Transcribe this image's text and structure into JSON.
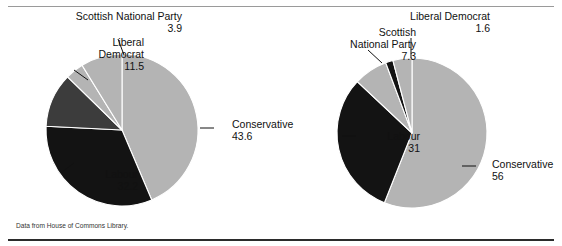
{
  "figure": {
    "source_note": "Data from House of Commons Library."
  },
  "chart_data": [
    {
      "type": "pie",
      "title": "",
      "chart_index": 0,
      "position": "left",
      "center": [
        122,
        130
      ],
      "radius": 76,
      "start_angle_deg": -90,
      "direction": "clockwise",
      "categories": [
        "Conservative",
        "Labour",
        "Liberal Democrat",
        "Scottish National Party",
        "Other"
      ],
      "values": [
        43.6,
        32.2,
        11.5,
        3.9,
        8.8
      ],
      "labeled_slices": [
        {
          "label": "Conservative",
          "value": "43.6",
          "color": "#b4b4b4",
          "label_x": 232,
          "label_y": 128,
          "leader": "M 200,128 L 214,128"
        },
        {
          "label": "Labour",
          "value": "32.2",
          "color": "#131313",
          "label_x": 18,
          "label_y": 178,
          "leader": "M 62,172 L 74,163"
        },
        {
          "label": "Liberal Democrat",
          "value": "11.5",
          "color": "#3c3c3c",
          "label_x": 24,
          "label_y": 46,
          "leader": "M 74,70 L 88,80"
        },
        {
          "label": "Scottish National Party",
          "value": "3.9",
          "color": "#b4b4b4",
          "label_x": 62,
          "label_y": 20,
          "leader": "M 118,39 L 124,55"
        }
      ],
      "legend": "none",
      "grid": false
    },
    {
      "type": "pie",
      "title": "",
      "chart_index": 1,
      "position": "right",
      "center": [
        412,
        133
      ],
      "radius": 75,
      "start_angle_deg": -90,
      "direction": "clockwise",
      "categories": [
        "Conservative",
        "Labour",
        "Scottish National Party",
        "Liberal Democrat",
        "Other"
      ],
      "values": [
        56,
        31,
        7.3,
        1.6,
        4.1
      ],
      "labeled_slices": [
        {
          "label": "Conservative",
          "value": "56",
          "color": "#b4b4b4",
          "label_x": 492,
          "label_y": 168,
          "leader": "M 462,166 L 476,166"
        },
        {
          "label": "Labour",
          "value": "31",
          "color": "#131313",
          "label_x": 300,
          "label_y": 140,
          "leader": "M 342,136 L 356,136"
        },
        {
          "label": "Scottish National Party",
          "value": "7.3",
          "color": "#b4b4b4",
          "label_x": 296,
          "label_y": 36,
          "leader": "M 368,50 L 382,63"
        },
        {
          "label": "Liberal Democrat",
          "value": "1.6",
          "color": "#131313",
          "label_x": 370,
          "label_y": 20,
          "leader": "M 411,38 L 411,58"
        }
      ],
      "legend": "none",
      "grid": false
    }
  ]
}
